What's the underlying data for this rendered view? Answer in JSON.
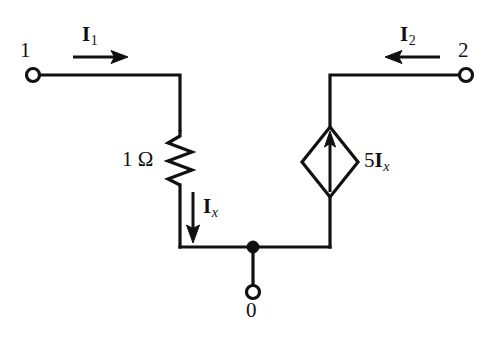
{
  "figure": {
    "type": "circuit-schematic",
    "background_color": "#ffffff",
    "line_color": "#111111",
    "width": 502,
    "height": 340
  },
  "nodes": [
    {
      "id": "1",
      "label": "1",
      "terminal": "open-circle",
      "x": 33,
      "y": 75
    },
    {
      "id": "2",
      "label": "2",
      "terminal": "open-circle",
      "x": 466,
      "y": 75
    },
    {
      "id": "0",
      "label": "0",
      "terminal": "open-circle",
      "x": 253,
      "y": 291
    }
  ],
  "components": {
    "resistor": {
      "name": "resistor",
      "value_label": "1 Ω",
      "value": 1,
      "unit": "Ω",
      "orientation": "vertical",
      "x": 180,
      "y_top": 130,
      "y_bottom": 185
    },
    "dependent_source": {
      "name": "current-controlled-current-source",
      "shape": "diamond",
      "arrow_direction": "up",
      "label_coefficient": "5",
      "label_symbol": "I",
      "label_subscript": "x",
      "label_text": "5I_x",
      "x": 330,
      "y": 162
    }
  },
  "currents": [
    {
      "name": "I1",
      "symbol": "I",
      "subscript": "1",
      "label_text": "I_1",
      "direction": "right",
      "description": "port 1 input current into the network"
    },
    {
      "name": "I2",
      "symbol": "I",
      "subscript": "2",
      "label_text": "I_2",
      "direction": "left",
      "description": "port 2 input current into the network"
    },
    {
      "name": "Ix",
      "symbol": "I",
      "subscript": "x",
      "label_text": "I_x",
      "direction": "down",
      "description": "controlling current through the 1 ohm resistor"
    }
  ],
  "junction_dot": {
    "name": "junction-dot",
    "x": 253,
    "y": 247
  }
}
